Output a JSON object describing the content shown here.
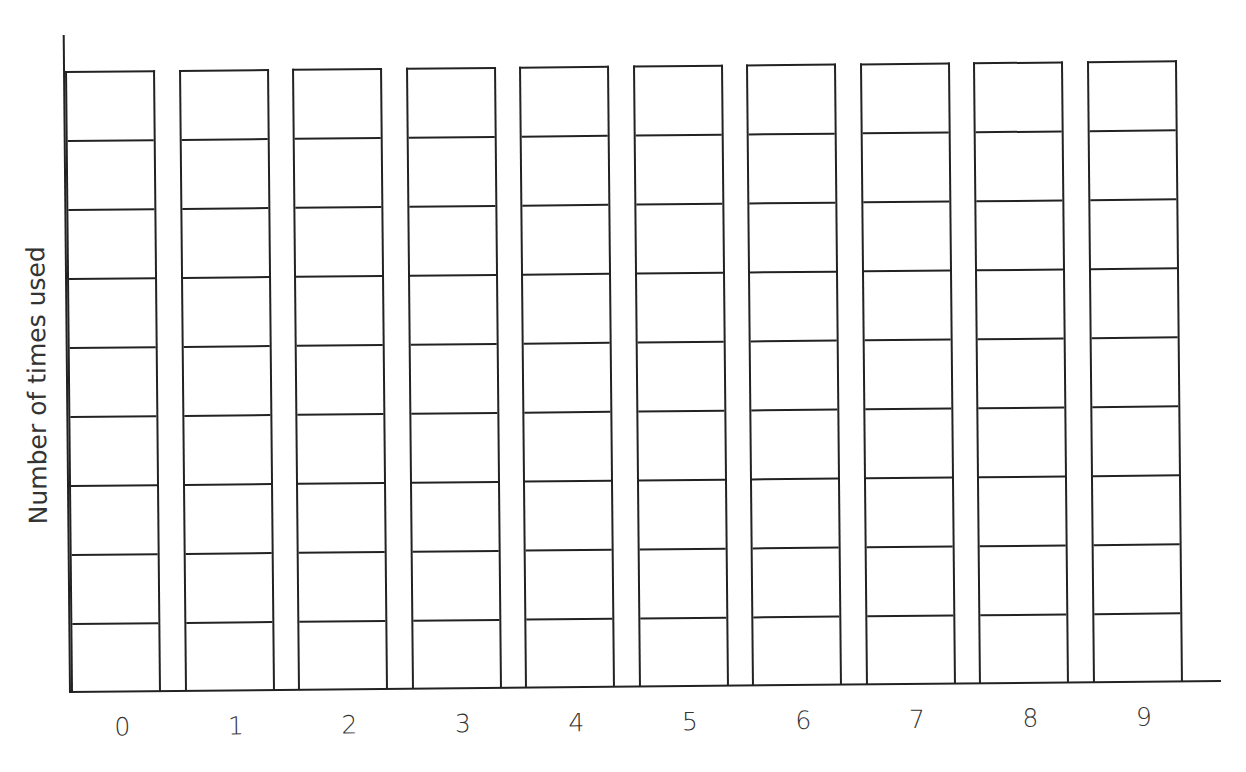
{
  "chart_data": {
    "type": "bar",
    "title": "",
    "xlabel": "",
    "ylabel": "Number of times used",
    "categories": [
      "0",
      "1",
      "2",
      "3",
      "4",
      "5",
      "6",
      "7",
      "8",
      "9"
    ],
    "values": [
      null,
      null,
      null,
      null,
      null,
      null,
      null,
      null,
      null,
      null
    ],
    "ylim": [
      0,
      9
    ],
    "grid": true,
    "cells_per_bar": 9,
    "note": "Blank bar-graph template: each category column divided into 9 empty cells to be filled in",
    "legend": null
  },
  "axis": {
    "ylabel": "Number of times used",
    "categories": [
      "0",
      "1",
      "2",
      "3",
      "4",
      "5",
      "6",
      "7",
      "8",
      "9"
    ]
  },
  "colors": {
    "line": "#222222",
    "text": "#333333",
    "background": "#ffffff"
  }
}
